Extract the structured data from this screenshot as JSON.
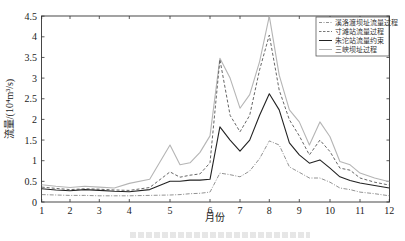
{
  "chart_data": {
    "type": "line",
    "title": "",
    "xlabel": "月份",
    "ylabel": "流量/(10⁴m³/s)",
    "xlim": [
      1,
      12
    ],
    "ylim": [
      0,
      4.5
    ],
    "x_ticks": [
      "1",
      "2",
      "3",
      "4",
      "5",
      "6",
      "7",
      "8",
      "9",
      "10",
      "11",
      "12"
    ],
    "y_ticks": [
      "0",
      "0.5",
      "1",
      "1.5",
      "2",
      "2.5",
      "3",
      "3.5",
      "4",
      "4.5"
    ],
    "grid": false,
    "legend_position": "upper right",
    "x": [
      1,
      1.5,
      2,
      2.5,
      3,
      3.5,
      4,
      4.5,
      5,
      5.25,
      5.5,
      5.75,
      6,
      6.33,
      6.67,
      7,
      7.33,
      7.67,
      8,
      8.33,
      8.67,
      9,
      9.33,
      9.67,
      10,
      10.33,
      10.67,
      11,
      11.5,
      12
    ],
    "series": [
      {
        "name": "溪洛渡坝址流量过程",
        "style": "dash-dot",
        "color": "#777777",
        "values": [
          0.18,
          0.17,
          0.16,
          0.16,
          0.15,
          0.15,
          0.15,
          0.16,
          0.17,
          0.18,
          0.2,
          0.21,
          0.24,
          0.7,
          0.66,
          0.61,
          0.75,
          1.05,
          1.48,
          1.38,
          0.85,
          0.72,
          0.58,
          0.58,
          0.48,
          0.34,
          0.3,
          0.24,
          0.2,
          0.15
        ]
      },
      {
        "name": "寸滩站流量过程",
        "style": "dashed",
        "color": "#555555",
        "values": [
          0.36,
          0.33,
          0.3,
          0.32,
          0.31,
          0.29,
          0.28,
          0.35,
          0.73,
          0.6,
          0.65,
          0.68,
          0.95,
          3.45,
          2.1,
          1.7,
          2.1,
          3.2,
          4.04,
          2.71,
          1.99,
          1.6,
          1.14,
          1.5,
          1.22,
          0.82,
          0.77,
          0.58,
          0.48,
          0.41
        ]
      },
      {
        "name": "朱沱站流量约束",
        "style": "solid",
        "color": "#222222",
        "values": [
          0.32,
          0.29,
          0.27,
          0.3,
          0.28,
          0.26,
          0.25,
          0.3,
          0.5,
          0.5,
          0.53,
          0.53,
          0.55,
          1.82,
          1.5,
          1.23,
          1.5,
          2.1,
          2.62,
          2.23,
          1.43,
          1.14,
          0.94,
          1.02,
          0.82,
          0.61,
          0.52,
          0.46,
          0.4,
          0.34
        ]
      },
      {
        "name": "三峡坝址过程",
        "style": "solid-light",
        "color": "#b5b5b5",
        "values": [
          0.42,
          0.38,
          0.35,
          0.38,
          0.36,
          0.34,
          0.45,
          0.55,
          1.38,
          0.9,
          0.95,
          1.2,
          1.6,
          3.48,
          3.0,
          2.27,
          2.6,
          3.4,
          4.5,
          3.07,
          2.23,
          1.94,
          1.38,
          1.94,
          1.58,
          0.98,
          0.9,
          0.7,
          0.58,
          0.49
        ]
      }
    ]
  },
  "legend": {
    "items": [
      {
        "label": "溪洛渡坝址流量过程"
      },
      {
        "label": "寸滩站流量过程"
      },
      {
        "label": "朱沱站流量约束"
      },
      {
        "label": "三峡坝址过程"
      }
    ]
  },
  "axes": {
    "xlabel": "月份",
    "ylabel": "流量/(10⁴m³/s)"
  }
}
